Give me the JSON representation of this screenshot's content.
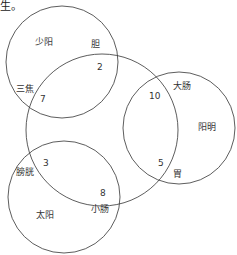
{
  "header_fragment": "生。",
  "colors": {
    "stroke": "#333333",
    "text": "#333333",
    "background": "#ffffff"
  },
  "circles": {
    "shaoyang": {
      "label": "少阳"
    },
    "center": {
      "label": ""
    },
    "yangming": {
      "label": "阳明"
    },
    "taiyang": {
      "label": "太阳"
    }
  },
  "organs": {
    "dan": "胆",
    "sanjiao": "三焦",
    "dachang": "大肠",
    "wei": "胃",
    "pangguang": "膀胱",
    "xiaochang": "小肠"
  },
  "numbers": {
    "dan": "2",
    "sanjiao": "7",
    "dachang": "10",
    "wei": "5",
    "pangguang": "3",
    "xiaochang": "8"
  }
}
